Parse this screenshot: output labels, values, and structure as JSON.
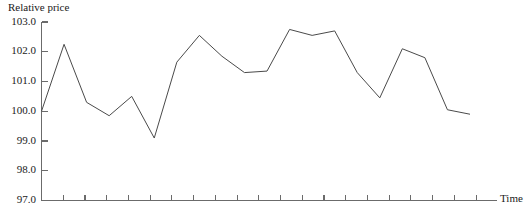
{
  "chart_data": {
    "type": "line",
    "title": "",
    "ylabel": "Relative price",
    "xlabel": "Time",
    "ylim": [
      97.0,
      103.0
    ],
    "ytick_labels": [
      "103.0",
      "102.0",
      "101.0",
      "100.0",
      "99.0",
      "98.0",
      "97.0"
    ],
    "ytick_values": [
      103.0,
      102.0,
      101.0,
      100.0,
      99.0,
      98.0,
      97.0
    ],
    "grid": false,
    "legend": null,
    "x_tick_count": 20,
    "x_tick_labels": [],
    "series": [
      {
        "name": "Relative price",
        "color": "#4a4a4a",
        "x": [
          1,
          2,
          3,
          4,
          5,
          6,
          7,
          8,
          9,
          10,
          11,
          12,
          13,
          14,
          15,
          16,
          17,
          18,
          19,
          20
        ],
        "values": [
          100.0,
          102.25,
          100.3,
          99.85,
          100.5,
          99.1,
          101.65,
          102.55,
          101.85,
          101.3,
          101.35,
          102.75,
          102.55,
          102.7,
          101.3,
          100.45,
          102.1,
          101.8,
          100.05,
          99.9
        ]
      }
    ]
  },
  "axes": {
    "y_axis_name": "y-axis",
    "x_axis_name": "x-axis"
  }
}
